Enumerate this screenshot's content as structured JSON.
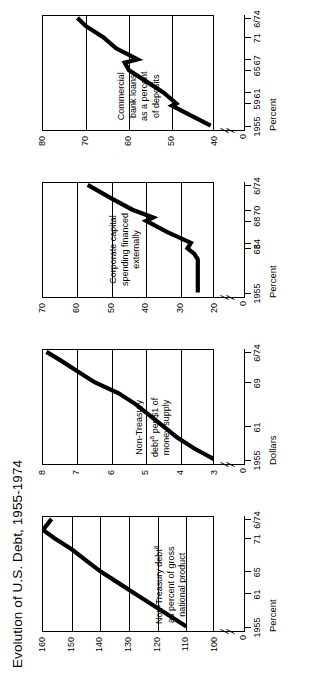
{
  "figure": {
    "title": "Evolution of U.S. Debt, 1955-1974"
  },
  "chart_data": [
    {
      "type": "line",
      "panel": 1,
      "title": "Non-Treasury debtᵃ as percent of gross national product",
      "annotation_lines": [
        "Non-Treasury debt",
        "as percent of gross",
        "national product"
      ],
      "annotation_superscript": "a",
      "xlabel": "Percent",
      "ylabel": "",
      "ylim": [
        100,
        160
      ],
      "yticks": [
        100,
        110,
        120,
        130,
        140,
        150,
        160
      ],
      "ytick_labels": [
        "100",
        "110",
        "120",
        "130",
        "140",
        "150",
        "160"
      ],
      "zero_label": "0",
      "xticks": [
        1955,
        1961,
        1965,
        1971,
        1974.5
      ],
      "xtick_labels": [
        "1955",
        "61",
        "65",
        "71",
        "6/74"
      ],
      "x": [
        1955,
        1957,
        1959,
        1961,
        1963,
        1965,
        1967,
        1969,
        1971,
        1972.5,
        1974.5
      ],
      "values": [
        110,
        116,
        122,
        128,
        134,
        140,
        145,
        150,
        156,
        160,
        157
      ]
    },
    {
      "type": "line",
      "panel": 2,
      "title": "Non-Treasury debtᵃ per $1 of money supply",
      "annotation_lines": [
        "Non-Treasury",
        "debt  per $1 of",
        "money supply"
      ],
      "annotation_superscript": "a",
      "xlabel": "Dollars",
      "ylabel": "",
      "ylim": [
        3,
        8
      ],
      "yticks": [
        3,
        4,
        5,
        6,
        7,
        8
      ],
      "ytick_labels": [
        "3",
        "4",
        "5",
        "6",
        "7",
        "8"
      ],
      "zero_label": "0",
      "xticks": [
        1955,
        1961,
        1969,
        1974.5
      ],
      "xtick_labels": [
        "1955",
        "61",
        "69",
        "6/74"
      ],
      "x": [
        1955,
        1957,
        1959,
        1961,
        1963,
        1965,
        1967,
        1969,
        1971,
        1973,
        1974.5
      ],
      "values": [
        3.0,
        3.6,
        4.1,
        4.5,
        4.9,
        5.3,
        5.8,
        6.5,
        7.0,
        7.5,
        7.9
      ]
    },
    {
      "type": "line",
      "panel": 3,
      "title": "Corporate capital spending financed externally",
      "annotation_lines": [
        "Corporate capital",
        "spending financed",
        "externally"
      ],
      "annotation_superscript": "",
      "xlabel": "Percent",
      "ylabel": "",
      "ylim": [
        20,
        70
      ],
      "yticks": [
        20,
        30,
        40,
        50,
        60,
        70
      ],
      "ytick_labels": [
        "20",
        "30",
        "40",
        "50",
        "60",
        "70"
      ],
      "zero_label": "0",
      "xticks": [
        1955,
        1963,
        1964,
        1968,
        1970,
        1974.5
      ],
      "xtick_labels": [
        "1955",
        "63",
        "64",
        "68",
        "70",
        "6/74"
      ],
      "x": [
        1955,
        1957,
        1959,
        1961,
        1962,
        1963,
        1964,
        1966,
        1968,
        1968.6,
        1970,
        1972,
        1974.5
      ],
      "values": [
        25,
        25,
        25,
        25,
        26,
        28,
        27,
        34,
        40,
        38,
        44,
        50,
        57
      ]
    },
    {
      "type": "line",
      "panel": 4,
      "title": "Commercial bank loans as a percent of deposits",
      "annotation_lines": [
        "Commercial",
        "bank loans",
        "as a percent",
        "of deposits"
      ],
      "annotation_superscript": "",
      "xlabel": "Percent",
      "ylabel": "",
      "ylim": [
        40,
        80
      ],
      "yticks": [
        40,
        50,
        60,
        70,
        80
      ],
      "ytick_labels": [
        "40",
        "50",
        "60",
        "70",
        "80"
      ],
      "zero_label": "0",
      "xticks": [
        1955,
        1959,
        1961,
        1965,
        1967,
        1971,
        1974.5
      ],
      "xtick_labels": [
        "1955",
        "59",
        "61",
        "65",
        "67",
        "71",
        "6/74"
      ],
      "x": [
        1955,
        1957,
        1958.6,
        1959,
        1961,
        1963,
        1965,
        1966.4,
        1967,
        1969,
        1971,
        1973,
        1974.5
      ],
      "values": [
        41,
        46,
        50,
        49,
        52,
        56,
        60,
        61,
        58,
        63,
        66,
        70,
        72
      ]
    }
  ]
}
